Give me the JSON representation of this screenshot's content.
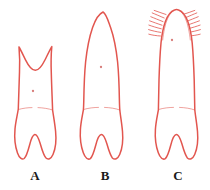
{
  "plate": {
    "background_color": "#ffffff",
    "outline_color": "#e2564f",
    "label_color": "#1a1a1a",
    "pulp_dot_color": "#c9504c"
  },
  "figures": [
    {
      "id": "A",
      "label": "A",
      "label_x": 35,
      "label_y": 180,
      "crown_type": "bifid-notched-crown",
      "description": "short crown with two pointed horn cusps and deep U-shaped notch between them",
      "has_bristles": false,
      "pulp_dot": {
        "x": 33,
        "y": 91
      },
      "cervical_line_y": 110,
      "bounds": {
        "x": 14,
        "y": 44,
        "width": 44,
        "height": 116
      }
    },
    {
      "id": "B",
      "label": "B",
      "label_x": 105,
      "label_y": 180,
      "crown_type": "pointed-conical-crown",
      "description": "tall tapering crown with rounded pointed apex",
      "has_bristles": false,
      "pulp_dot": {
        "x": 101,
        "y": 67
      },
      "cervical_line_y": 110,
      "bounds": {
        "x": 80,
        "y": 10,
        "width": 46,
        "height": 150
      }
    },
    {
      "id": "C",
      "label": "C",
      "label_x": 178,
      "label_y": 180,
      "crown_type": "bristled-rounded-crown",
      "description": "narrow crown with rounded apex fringed by fine bristles on both sides",
      "has_bristles": true,
      "bristles_per_side": 7,
      "pulp_dot": {
        "x": 172,
        "y": 40
      },
      "cervical_line_y": 110,
      "bounds": {
        "x": 152,
        "y": 8,
        "width": 48,
        "height": 152
      }
    }
  ]
}
